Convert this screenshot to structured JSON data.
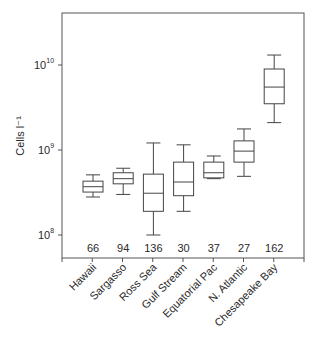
{
  "chart_data": {
    "type": "boxplot",
    "title": "",
    "xlabel": "",
    "ylabel": "Cells l⁻¹",
    "yscale": "log",
    "ylim": [
      51000000.0,
      41000000000.0
    ],
    "yticks": [
      {
        "value": 100000000.0,
        "label_base": "10",
        "label_exp": "8"
      },
      {
        "value": 1000000000.0,
        "label_base": "10",
        "label_exp": "9"
      },
      {
        "value": 10000000000.0,
        "label_base": "10",
        "label_exp": "10"
      }
    ],
    "grid": false,
    "legend": null,
    "categories": [
      "Hawaii",
      "Sargasso",
      "Ross Sea",
      "Gulf Stream",
      "Equatorial Pac",
      "N. Atlantic",
      "Chesapeake Bay"
    ],
    "n": [
      66,
      94,
      136,
      30,
      37,
      27,
      162
    ],
    "boxes": [
      {
        "category": "Hawaii",
        "whisker_low": 280000000.0,
        "q1": 320000000.0,
        "median": 370000000.0,
        "q3": 430000000.0,
        "whisker_high": 510000000.0
      },
      {
        "category": "Sargasso",
        "whisker_low": 300000000.0,
        "q1": 400000000.0,
        "median": 460000000.0,
        "q3": 540000000.0,
        "whisker_high": 610000000.0
      },
      {
        "category": "Ross Sea",
        "whisker_low": 100000000.0,
        "q1": 190000000.0,
        "median": 310000000.0,
        "q3": 520000000.0,
        "whisker_high": 1210000000.0
      },
      {
        "category": "Gulf Stream",
        "whisker_low": 190000000.0,
        "q1": 290000000.0,
        "median": 420000000.0,
        "q3": 720000000.0,
        "whisker_high": 1150000000.0
      },
      {
        "category": "Equatorial Pac",
        "whisker_low": 460000000.0,
        "q1": 470000000.0,
        "median": 540000000.0,
        "q3": 720000000.0,
        "whisker_high": 850000000.0
      },
      {
        "category": "N. Atlantic",
        "whisker_low": 490000000.0,
        "q1": 720000000.0,
        "median": 970000000.0,
        "q3": 1280000000.0,
        "whisker_high": 1770000000.0
      },
      {
        "category": "Chesapeake Bay",
        "whisker_low": 2100000000.0,
        "q1": 3500000000.0,
        "median": 5500000000.0,
        "q3": 8970000000.0,
        "whisker_high": 13100000000.0
      }
    ]
  }
}
